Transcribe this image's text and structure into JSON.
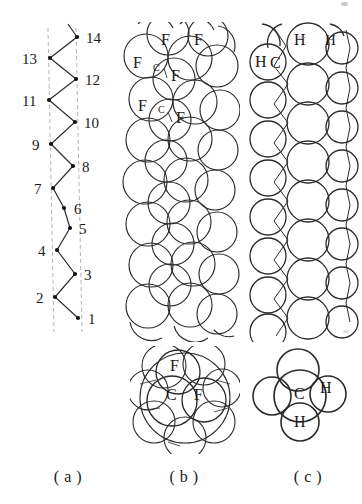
{
  "figure": {
    "type": "molecular-structure-diagram",
    "background_color": "#ffffff",
    "line_color": "#1a1a1a",
    "guide_line_color": "#b0b0b0"
  },
  "captions": {
    "a": "( a )",
    "b": "( b )",
    "c": "( c )"
  },
  "panel_a": {
    "name": "carbon-backbone-zigzag",
    "guide_lines": 2,
    "atom_count": 14,
    "labels_right": [
      "14",
      "12",
      "10",
      "8",
      "6",
      "5",
      "3",
      "1"
    ],
    "labels_left": [
      "13",
      "11",
      "9",
      "7",
      "4",
      "2"
    ],
    "vertices": [
      {
        "n": "1",
        "x": 78,
        "y": 296,
        "side": "right"
      },
      {
        "n": "2",
        "x": 55,
        "y": 275,
        "side": "left"
      },
      {
        "n": "3",
        "x": 75,
        "y": 252,
        "side": "right"
      },
      {
        "n": "4",
        "x": 57,
        "y": 228,
        "side": "left"
      },
      {
        "n": "5",
        "x": 70,
        "y": 206,
        "side": "right"
      },
      {
        "n": "6",
        "x": 64,
        "y": 186,
        "side": "right"
      },
      {
        "n": "7",
        "x": 53,
        "y": 166,
        "side": "left"
      },
      {
        "n": "8",
        "x": 73,
        "y": 144,
        "side": "right"
      },
      {
        "n": "9",
        "x": 51,
        "y": 122,
        "side": "left"
      },
      {
        "n": "10",
        "x": 75,
        "y": 100,
        "side": "right"
      },
      {
        "n": "11",
        "x": 49,
        "y": 78,
        "side": "left"
      },
      {
        "n": "12",
        "x": 76,
        "y": 57,
        "side": "right"
      },
      {
        "n": "13",
        "x": 50,
        "y": 36,
        "side": "left"
      },
      {
        "n": "14",
        "x": 77,
        "y": 15,
        "side": "right"
      }
    ]
  },
  "panel_b": {
    "name": "ptfe-helix-space-filling",
    "chain_label": "PTFE",
    "atom_labels": [
      {
        "text": "F",
        "x": 43,
        "y": 18,
        "size": "big"
      },
      {
        "text": "F",
        "x": 76,
        "y": 18,
        "size": "big"
      },
      {
        "text": "F",
        "x": 15,
        "y": 41,
        "size": "big"
      },
      {
        "text": "C",
        "x": 35,
        "y": 47,
        "size": "small"
      },
      {
        "text": "F",
        "x": 53,
        "y": 54,
        "size": "big"
      },
      {
        "text": "F",
        "x": 20,
        "y": 84,
        "size": "big"
      },
      {
        "text": "C",
        "x": 40,
        "y": 89,
        "size": "small"
      },
      {
        "text": "F",
        "x": 58,
        "y": 96,
        "size": "big"
      }
    ]
  },
  "panel_c": {
    "name": "polyethylene-planar-zigzag-space-filling",
    "chain_label": "polyethylene",
    "atom_labels": [
      {
        "text": "H",
        "x": 48,
        "y": 17,
        "size": "big"
      },
      {
        "text": "H",
        "x": 79,
        "y": 18,
        "size": "mid"
      },
      {
        "text": "H",
        "x": 11,
        "y": 40,
        "size": "big"
      },
      {
        "text": "C",
        "x": 28,
        "y": 41,
        "size": "big"
      }
    ]
  },
  "panel_b_molecule": {
    "name": "cf2-cross-section",
    "center_atom": "C",
    "labels": [
      {
        "text": "F",
        "x": 40,
        "y": 20
      },
      {
        "text": "C",
        "x": 38,
        "y": 48
      },
      {
        "text": "F",
        "x": 64,
        "y": 48
      }
    ]
  },
  "panel_c_molecule": {
    "name": "ch2-cross-section",
    "center_atom": "C",
    "labels": [
      {
        "text": "C",
        "x": 44,
        "y": 45
      },
      {
        "text": "H",
        "x": 68,
        "y": 40
      },
      {
        "text": "H",
        "x": 42,
        "y": 74
      }
    ]
  }
}
